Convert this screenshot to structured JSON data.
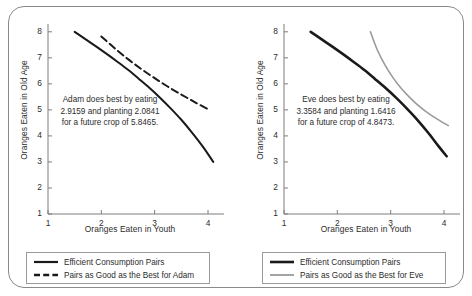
{
  "chart_data": [
    {
      "type": "line",
      "panel": "adam",
      "title": "",
      "xlabel": "Oranges Eaten in Youth",
      "ylabel": "Oranges Eaten in Old Age",
      "xlim": [
        1,
        4.3
      ],
      "ylim": [
        1,
        8.3
      ],
      "xticks": [
        1,
        2,
        3,
        4
      ],
      "yticks": [
        1,
        2,
        3,
        4,
        5,
        6,
        7,
        8
      ],
      "grid": false,
      "legend_position": "below",
      "annotation": "Adam does best by eating 2.9159 and planting 2.0841 for a future crop of 5.8465.",
      "optimum": {
        "eat": 2.9159,
        "plant": 2.0841,
        "future_crop": 5.8465
      },
      "series": [
        {
          "name": "Efficient Consumption Pairs",
          "style": "solid",
          "color": "#1a1a1a",
          "width": 2.0,
          "points": [
            [
              1.5,
              8.0
            ],
            [
              1.7,
              7.72
            ],
            [
              1.9,
              7.44
            ],
            [
              2.1,
              7.15
            ],
            [
              2.3,
              6.85
            ],
            [
              2.5,
              6.54
            ],
            [
              2.7,
              6.2
            ],
            [
              2.9,
              5.85
            ],
            [
              3.1,
              5.47
            ],
            [
              3.3,
              5.06
            ],
            [
              3.5,
              4.62
            ],
            [
              3.7,
              4.13
            ],
            [
              3.9,
              3.6
            ],
            [
              4.1,
              3.0
            ]
          ]
        },
        {
          "name": "Pairs as Good as the Best for Adam",
          "style": "dashed",
          "color": "#1a1a1a",
          "width": 2.0,
          "points": [
            [
              2.0,
              7.82
            ],
            [
              2.25,
              7.37
            ],
            [
              2.5,
              6.95
            ],
            [
              2.75,
              6.57
            ],
            [
              3.0,
              6.22
            ],
            [
              3.25,
              5.89
            ],
            [
              3.5,
              5.59
            ],
            [
              3.75,
              5.3
            ],
            [
              4.0,
              5.03
            ]
          ]
        }
      ]
    },
    {
      "type": "line",
      "panel": "eve",
      "title": "",
      "xlabel": "Oranges Eaten in Youth",
      "ylabel": "Oranges Eaten in Old Age",
      "xlim": [
        1,
        4.3
      ],
      "ylim": [
        1,
        8.3
      ],
      "xticks": [
        1,
        2,
        3,
        4
      ],
      "yticks": [
        1,
        2,
        3,
        4,
        5,
        6,
        7,
        8
      ],
      "grid": false,
      "legend_position": "below",
      "annotation": "Eve does best by eating 3.3584 and planting 1.6416 for a future crop of 4.8473.",
      "optimum": {
        "eat": 3.3584,
        "plant": 1.6416,
        "future_crop": 4.8473
      },
      "series": [
        {
          "name": "Efficient Consumption Pairs",
          "style": "solid",
          "color": "#1a1a1a",
          "width": 2.6,
          "points": [
            [
              1.5,
              8.0
            ],
            [
              1.7,
              7.72
            ],
            [
              1.9,
              7.44
            ],
            [
              2.1,
              7.15
            ],
            [
              2.3,
              6.85
            ],
            [
              2.5,
              6.54
            ],
            [
              2.7,
              6.2
            ],
            [
              2.9,
              5.85
            ],
            [
              3.1,
              5.47
            ],
            [
              3.3,
              5.06
            ],
            [
              3.5,
              4.62
            ],
            [
              3.7,
              4.13
            ],
            [
              3.9,
              3.6
            ],
            [
              4.05,
              3.22
            ]
          ]
        },
        {
          "name": "Pairs as Good as the Best for Eve",
          "style": "solid",
          "color": "#9a9a9a",
          "width": 1.6,
          "points": [
            [
              2.62,
              8.0
            ],
            [
              2.75,
              7.3
            ],
            [
              2.9,
              6.7
            ],
            [
              3.05,
              6.22
            ],
            [
              3.2,
              5.82
            ],
            [
              3.36,
              5.47
            ],
            [
              3.5,
              5.2
            ],
            [
              3.65,
              4.95
            ],
            [
              3.8,
              4.74
            ],
            [
              3.95,
              4.55
            ],
            [
              4.08,
              4.4
            ]
          ]
        }
      ]
    }
  ],
  "panels": {
    "adam": {
      "xlabel": "Oranges Eaten in Youth",
      "ylabel": "Oranges Eaten in Old Age",
      "annotation": "Adam does best by eating 2.9159 and planting 2.0841 for a future crop of 5.8465.",
      "xticks": [
        "1",
        "2",
        "3",
        "4"
      ],
      "yticks": [
        "8",
        "7",
        "6",
        "5",
        "4",
        "3",
        "2",
        "1"
      ],
      "legend": [
        {
          "label": "Efficient Consumption Pairs",
          "style": "solid",
          "color": "#1a1a1a"
        },
        {
          "label": "Pairs as Good as the Best for Adam",
          "style": "dashed",
          "color": "#1a1a1a"
        }
      ]
    },
    "eve": {
      "xlabel": "Oranges Eaten in Youth",
      "ylabel": "Oranges Eaten in Old Age",
      "annotation": "Eve does best by eating 3.3584 and planting 1.6416 for a future crop of 4.8473.",
      "xticks": [
        "1",
        "2",
        "3",
        "4"
      ],
      "yticks": [
        "8",
        "7",
        "6",
        "5",
        "4",
        "3",
        "2",
        "1"
      ],
      "legend": [
        {
          "label": "Efficient Consumption Pairs",
          "style": "solid",
          "color": "#1a1a1a"
        },
        {
          "label": "Pairs as Good as the Best for Eve",
          "style": "solid",
          "color": "#9a9a9a"
        }
      ]
    }
  },
  "colors": {
    "axis": "#7d7d7d",
    "text": "#2c2c2c",
    "solid_curve": "#1a1a1a",
    "gray_curve": "#9a9a9a",
    "frame": "#8a8a8a"
  }
}
